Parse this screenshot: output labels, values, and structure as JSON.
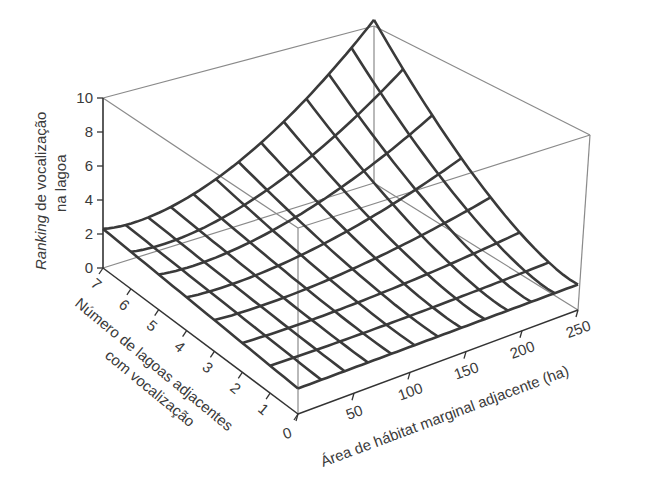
{
  "chart_data": {
    "type": "surface3d",
    "title": "",
    "zlabel_italic": "Ranking",
    "zlabel_rest": " de vocalização",
    "zlabel_line2": "na lagoa",
    "xlabel": "Área de hábitat marginal adjacente (ha)",
    "ylabel_line1": "Número de lagoas adjacentes",
    "ylabel_line2": "com vocalização",
    "x_ticks": [
      0,
      50,
      100,
      150,
      200,
      250
    ],
    "y_ticks": [
      0,
      1,
      2,
      3,
      4,
      5,
      6,
      7
    ],
    "z_ticks": [
      0,
      2,
      4,
      6,
      8,
      10
    ],
    "xlim": [
      0,
      250
    ],
    "ylim": [
      0,
      7
    ],
    "zlim": [
      0,
      10
    ],
    "grid_x_divisions": 12,
    "grid_y_divisions": 7,
    "corner_values": {
      "area0_n0": 1.5,
      "area250_n0": 1.5,
      "area0_n7": 2.3,
      "area250_n7": 9.6
    },
    "surface_model": "z = a + b*exp(c*area/250 + d*n/7) approx; increases with both area and number of vocalizing ponds, steepest at high area & high n",
    "grid_on": false
  },
  "colors": {
    "surface_line": "#3a3a3a",
    "box_line": "#8a8a8a",
    "axis_line": "#333333"
  }
}
